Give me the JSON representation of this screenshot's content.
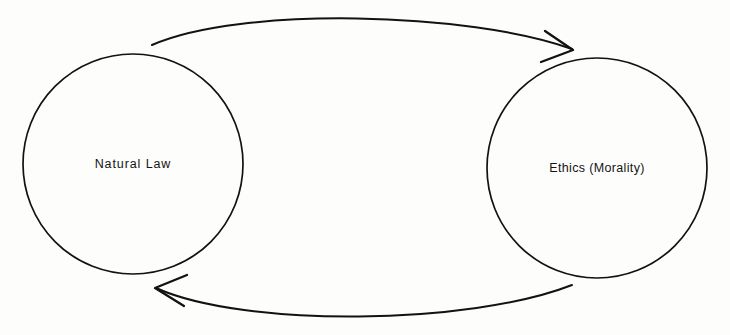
{
  "diagram": {
    "background_color": "#fdfdfc",
    "stroke_color": "#121212",
    "nodes": [
      {
        "id": "natural-law",
        "label": "Natural Law",
        "shape": "circle",
        "cx": 133,
        "cy": 164,
        "r": 110
      },
      {
        "id": "ethics-morality",
        "label": "Ethics (Morality)",
        "shape": "circle",
        "cx": 597,
        "cy": 168,
        "r": 110
      }
    ],
    "edges": [
      {
        "id": "top-arc",
        "from": "natural-law",
        "to": "ethics-morality",
        "direction": "left-to-right",
        "arrowhead": "right",
        "path": "M 152 45 C 240 6, 470 12, 572 49",
        "head_path": "M 545 31 L 573 50 L 541 62"
      },
      {
        "id": "bottom-arc",
        "from": "ethics-morality",
        "to": "natural-law",
        "direction": "right-to-left",
        "arrowhead": "left",
        "path": "M 572 285 C 470 325, 245 328, 156 288",
        "head_path": "M 184 306 L 155 288 L 187 275"
      }
    ]
  }
}
